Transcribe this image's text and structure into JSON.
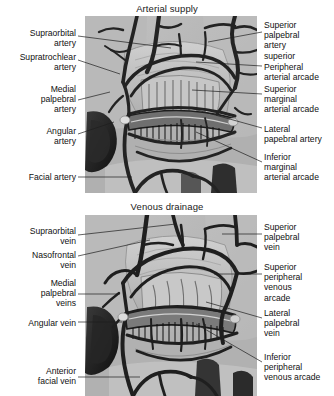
{
  "figure": {
    "line_color": "#1e1e1e",
    "plate_background": "#b4b4b4",
    "vessel_color": "#2b2b2b"
  },
  "panels": [
    {
      "id": "arterial",
      "title": "Arterial supply",
      "labels_left": [
        {
          "name": "supraorbital-artery",
          "text": "Supraorbital\nartery",
          "x": 12,
          "y": 28,
          "w": 64,
          "leader": {
            "x1": 78,
            "y1": 36,
            "x2": 171,
            "y2": 48
          }
        },
        {
          "name": "supratrochlear-artery",
          "text": "Supratrochlear\nartery",
          "x": 2,
          "y": 52,
          "w": 74,
          "leader": {
            "x1": 78,
            "y1": 60,
            "x2": 120,
            "y2": 74
          }
        },
        {
          "name": "medial-palpebral-artery",
          "text": "Medial\npalpebral\nartery",
          "x": 16,
          "y": 84,
          "w": 60,
          "leader": {
            "x1": 78,
            "y1": 100,
            "x2": 110,
            "y2": 92
          }
        },
        {
          "name": "angular-artery",
          "text": "Angular\nartery",
          "x": 16,
          "y": 126,
          "w": 60,
          "leader": {
            "x1": 78,
            "y1": 134,
            "x2": 114,
            "y2": 122
          }
        },
        {
          "name": "facial-artery",
          "text": "Facial artery",
          "x": 8,
          "y": 172,
          "w": 68,
          "leader": {
            "x1": 78,
            "y1": 177,
            "x2": 132,
            "y2": 177
          }
        }
      ],
      "labels_right": [
        {
          "name": "superior-palpebral-artery-superior",
          "text": "Superior\npalpebral\nartery\nsuperior",
          "x": 264,
          "y": 20,
          "w": 70,
          "leader": {
            "x1": 262,
            "y1": 32,
            "x2": 208,
            "y2": 42
          }
        },
        {
          "name": "peripheral-arterial-arcade",
          "text": "Peripheral\narterial arcade",
          "x": 264,
          "y": 62,
          "w": 70,
          "leader": {
            "x1": 262,
            "y1": 66,
            "x2": 196,
            "y2": 62
          }
        },
        {
          "name": "superior-marginal-arterial-arcade",
          "text": "Superior\nmarginal\narterial arcade",
          "x": 264,
          "y": 84,
          "w": 70,
          "leader": {
            "x1": 262,
            "y1": 94,
            "x2": 192,
            "y2": 90
          }
        },
        {
          "name": "lateral-papebral-artery",
          "text": "Lateral\npapebral artery",
          "x": 264,
          "y": 124,
          "w": 70,
          "leader": {
            "x1": 262,
            "y1": 128,
            "x2": 190,
            "y2": 108
          }
        },
        {
          "name": "inferior-marginal-arterial-arcade",
          "text": "Inferior\nmarginal\narterial arcade",
          "x": 264,
          "y": 152,
          "w": 70,
          "leader": {
            "x1": 262,
            "y1": 162,
            "x2": 196,
            "y2": 132
          }
        }
      ]
    },
    {
      "id": "venous",
      "title": "Venous drainage",
      "labels_left": [
        {
          "name": "supraorbital-vein",
          "text": "Supraorbital\nvein",
          "x": 10,
          "y": 226,
          "w": 66,
          "leader": {
            "x1": 78,
            "y1": 235,
            "x2": 176,
            "y2": 224
          }
        },
        {
          "name": "nasofrontal-vein",
          "text": "Nasofrontal\nvein",
          "x": 10,
          "y": 250,
          "w": 66,
          "leader": {
            "x1": 78,
            "y1": 256,
            "x2": 150,
            "y2": 240
          }
        },
        {
          "name": "medial-palpebral-veins",
          "text": "Medial\npalpebral\nveins",
          "x": 16,
          "y": 278,
          "w": 60,
          "leader": {
            "x1": 78,
            "y1": 294,
            "x2": 120,
            "y2": 294
          }
        },
        {
          "name": "angular-vein",
          "text": "Angular vein",
          "x": 10,
          "y": 318,
          "w": 66,
          "leader": {
            "x1": 78,
            "y1": 322,
            "x2": 122,
            "y2": 322
          }
        },
        {
          "name": "anterior-facial-vein",
          "text": "Anterior\nfacial vein",
          "x": 12,
          "y": 366,
          "w": 64,
          "leader": {
            "x1": 78,
            "y1": 377,
            "x2": 140,
            "y2": 377
          }
        }
      ],
      "labels_right": [
        {
          "name": "superior-palpebral-vein",
          "text": "Superior\npalpebral\nvein",
          "x": 264,
          "y": 222,
          "w": 70,
          "leader": {
            "x1": 262,
            "y1": 234,
            "x2": 222,
            "y2": 234
          }
        },
        {
          "name": "superior-peripheral-venous-arcade",
          "text": "Superior\nperipheral\nvenous\narcade",
          "x": 264,
          "y": 262,
          "w": 70,
          "leader": {
            "x1": 262,
            "y1": 274,
            "x2": 214,
            "y2": 274
          }
        },
        {
          "name": "lateral-palpebral-vein",
          "text": "Lateral\npalpebral\nvein",
          "x": 264,
          "y": 308,
          "w": 70,
          "leader": {
            "x1": 262,
            "y1": 318,
            "x2": 206,
            "y2": 302
          }
        },
        {
          "name": "inferior-peripheral-venous-arcade",
          "text": "Inferior\nperipheral\nvenous arcade",
          "x": 264,
          "y": 352,
          "w": 70,
          "leader": {
            "x1": 262,
            "y1": 362,
            "x2": 196,
            "y2": 324
          }
        }
      ]
    }
  ]
}
